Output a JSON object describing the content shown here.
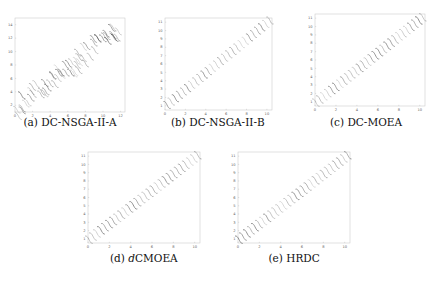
{
  "chart_data": [
    {
      "id": "a",
      "type": "scatter",
      "caption_prefix": "(a)",
      "caption_name": "DC-NSGA-II-A",
      "title": "",
      "xlabel": "",
      "ylabel": "",
      "xlim": [
        0,
        12.5
      ],
      "ylim": [
        1,
        15
      ],
      "xticks": [
        0,
        2,
        4,
        6,
        8,
        10,
        12
      ],
      "yticks": [
        2,
        4,
        6,
        8,
        10,
        12,
        14
      ],
      "grid": false,
      "description": "Scattered, noisy diagonal stripes of points; dense clusters near x=1-2,y=5-7 and x=4-6,y=8-11; several offset duplicate stripes",
      "stripes": {
        "count": 22,
        "x_start": 0.3,
        "x_end": 11.6,
        "y_offset": 1.0,
        "slope": 1.05,
        "len": 0.9,
        "jitter": 1
      }
    },
    {
      "id": "b",
      "type": "scatter",
      "caption_prefix": "(b)",
      "caption_name": "DC-NSGA-II-B",
      "title": "",
      "xlabel": "",
      "ylabel": "",
      "xlim": [
        0,
        10.5
      ],
      "ylim": [
        0.5,
        11.5
      ],
      "xticks": [
        0,
        2,
        4,
        6,
        8,
        10
      ],
      "yticks": [
        1,
        2,
        3,
        4,
        5,
        6,
        7,
        8,
        9,
        10,
        11
      ],
      "grid": false,
      "description": "Regular diagonal stripes of short wavy segments, sparser in the middle",
      "stripes": {
        "count": 26,
        "x_start": 0.2,
        "x_end": 10.3,
        "y_offset": 0.9,
        "slope": 1.0,
        "len": 0.75,
        "jitter": 0
      }
    },
    {
      "id": "c",
      "type": "scatter",
      "caption_prefix": "(c)",
      "caption_name": "DC-MOEA",
      "title": "",
      "xlabel": "",
      "ylabel": "",
      "xlim": [
        0,
        10.5
      ],
      "ylim": [
        0.5,
        11.5
      ],
      "xticks": [
        0,
        2,
        4,
        6,
        8,
        10
      ],
      "yticks": [
        1,
        2,
        3,
        4,
        5,
        6,
        7,
        8,
        9,
        10,
        11
      ],
      "grid": false,
      "description": "Even diagonal band of S-shaped wave segments from lower-left to upper-right",
      "stripes": {
        "count": 28,
        "x_start": 0.1,
        "x_end": 10.3,
        "y_offset": 0.8,
        "slope": 1.0,
        "len": 0.8,
        "jitter": 0
      }
    },
    {
      "id": "d",
      "type": "scatter",
      "caption_prefix": "(d)",
      "caption_italic": "d",
      "caption_name": "CMOEA",
      "title": "",
      "xlabel": "",
      "ylabel": "",
      "xlim": [
        0,
        10.5
      ],
      "ylim": [
        0.5,
        11.5
      ],
      "xticks": [
        0,
        2,
        4,
        6,
        8,
        10
      ],
      "yticks": [
        1,
        2,
        3,
        4,
        5,
        6,
        7,
        8,
        9,
        10,
        11
      ],
      "grid": false,
      "description": "Diagonal band of wave segments; denser cluster around x=4.5-6, y=6-8",
      "stripes": {
        "count": 28,
        "x_start": 0.1,
        "x_end": 10.3,
        "y_offset": 0.8,
        "slope": 1.0,
        "len": 0.8,
        "jitter": 0
      }
    },
    {
      "id": "e",
      "type": "scatter",
      "caption_prefix": "(e)",
      "caption_name": "HRDC",
      "title": "",
      "xlabel": "",
      "ylabel": "",
      "xlim": [
        0,
        10.5
      ],
      "ylim": [
        0.5,
        11.5
      ],
      "xticks": [
        0,
        2,
        4,
        6,
        8,
        10
      ],
      "yticks": [
        1,
        2,
        3,
        4,
        5,
        6,
        7,
        8,
        9,
        10,
        11
      ],
      "grid": false,
      "description": "Diagonal band of S-shaped wave segments with darker cluster near x=4.5-6",
      "stripes": {
        "count": 28,
        "x_start": 0.1,
        "x_end": 10.3,
        "y_offset": 0.8,
        "slope": 1.0,
        "len": 0.8,
        "jitter": 0
      }
    }
  ],
  "layout": {
    "panels": [
      {
        "id": "a",
        "left": 15,
        "top": 18,
        "width": 110,
        "height": 94,
        "cap_x": 70,
        "cap_y": 123
      },
      {
        "id": "b",
        "left": 165,
        "top": 18,
        "width": 107,
        "height": 92,
        "cap_x": 218,
        "cap_y": 123
      },
      {
        "id": "c",
        "left": 315,
        "top": 14,
        "width": 110,
        "height": 92,
        "cap_x": 366,
        "cap_y": 123
      },
      {
        "id": "d",
        "left": 88,
        "top": 152,
        "width": 112,
        "height": 91,
        "cap_x": 144,
        "cap_y": 259
      },
      {
        "id": "e",
        "left": 238,
        "top": 152,
        "width": 112,
        "height": 91,
        "cap_x": 294,
        "cap_y": 259
      }
    ],
    "frame_color": "#cccccc",
    "stroke_color": "#222222"
  }
}
